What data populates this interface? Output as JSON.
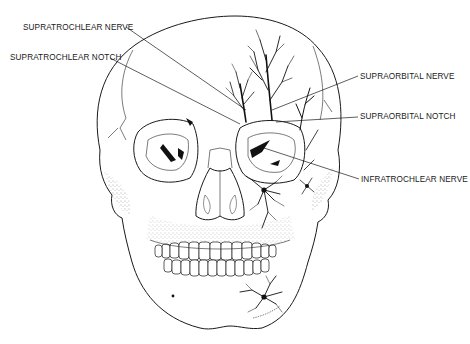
{
  "figure": {
    "labels": [
      {
        "id": "supratrochlear-nerve",
        "text": "SUPRATROCHLEAR NERVE",
        "side": "left"
      },
      {
        "id": "supratrochlear-notch",
        "text": "SUPRATROCHLEAR NOTCH",
        "side": "left"
      },
      {
        "id": "supraorbital-nerve",
        "text": "SUPRAORBITAL NERVE",
        "side": "right"
      },
      {
        "id": "supraorbital-notch",
        "text": "SUPRAORBITAL NOTCH",
        "side": "right"
      },
      {
        "id": "infratrochlear-nerve",
        "text": "INFRATROCHLEAR NERVE",
        "side": "right"
      }
    ]
  }
}
